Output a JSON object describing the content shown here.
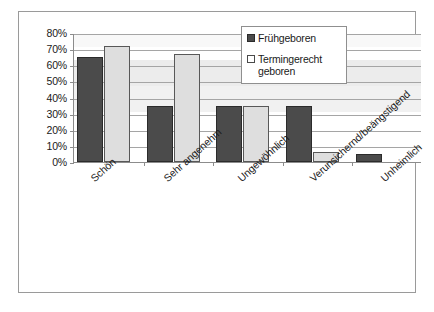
{
  "chart_data": {
    "type": "bar",
    "title": "",
    "xlabel": "",
    "ylabel": "",
    "ylim": [
      0,
      80
    ],
    "ytick_labels": [
      "80%",
      "70%",
      "60%",
      "50%",
      "40%",
      "30%",
      "20%",
      "10%",
      "0%"
    ],
    "ytick_values": [
      80,
      70,
      60,
      50,
      40,
      30,
      20,
      10,
      0
    ],
    "grid": true,
    "legend_position": "top-right",
    "categories": [
      "Schön",
      "Sehr angenehm",
      "Ungewöhnlich",
      "Verunsichernd/beängstigend",
      "Unheimlich"
    ],
    "series": [
      {
        "name": "Frühgeboren",
        "color": "#4b4b4b",
        "values": [
          65,
          35,
          35,
          35,
          5
        ]
      },
      {
        "name": "Termingerecht geboren",
        "color": "#dedede",
        "values": [
          72,
          67,
          35,
          6,
          0
        ]
      }
    ]
  },
  "legend": {
    "items": [
      {
        "label": "Frühgeboren"
      },
      {
        "label": "Termingerecht geboren"
      }
    ]
  }
}
